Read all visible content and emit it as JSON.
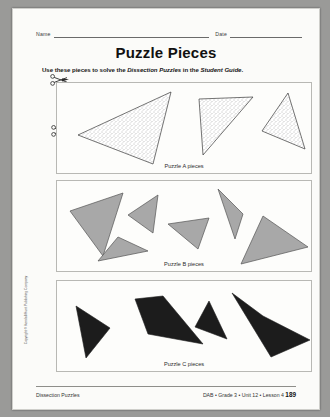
{
  "page": {
    "title": "Puzzle Pieces",
    "name_label": "Name",
    "date_label": "Date",
    "instruction_prefix": "Use these pieces to solve the ",
    "instruction_italic_1": "Dissection Puzzles",
    "instruction_middle": " in the ",
    "instruction_italic_2": "Student Guide",
    "instruction_suffix": ".",
    "copyright": "Copyright © Kendall/Hunt Publishing Company"
  },
  "footer": {
    "left": "Dissection Puzzles",
    "right": "DAB  •  Grade 3  •  Unit 12  •  Lesson 4",
    "page_number": "189"
  },
  "colors": {
    "paper": "#fbfbf9",
    "stipple_fill": "#ffffff",
    "stipple_dot": "#6b6b6b",
    "gray_fill": "#a8a8a8",
    "black_fill": "#1c1c1c",
    "outline": "#3a3a3a",
    "box_border": "#b8b8b4"
  },
  "puzzles": [
    {
      "id": "a",
      "label": "Puzzle A pieces",
      "fill_style": "stippled",
      "piece_count": 3,
      "pieces": [
        {
          "name": "piece-a-1",
          "shape": "triangle",
          "points": "21,52 114,9 96,81"
        },
        {
          "name": "piece-a-2",
          "shape": "triangle",
          "points": "142,16 196,14 146,72"
        },
        {
          "name": "piece-a-3",
          "shape": "triangle",
          "points": "231,10 248,66 205,48"
        }
      ]
    },
    {
      "id": "b",
      "label": "Puzzle B pieces",
      "fill_style": "gray",
      "piece_count": 6,
      "pieces": [
        {
          "name": "piece-b-1",
          "shape": "triangle",
          "points": "13,30 66,12 46,75"
        },
        {
          "name": "piece-b-2",
          "shape": "triangle",
          "points": "71,34 101,14 96,52"
        },
        {
          "name": "piece-b-3",
          "shape": "triangle",
          "points": "41,80 61,56 91,70"
        },
        {
          "name": "piece-b-4",
          "shape": "triangle",
          "points": "111,43 152,37 141,68"
        },
        {
          "name": "piece-b-5",
          "shape": "triangle",
          "points": "161,8 186,33 178,58"
        },
        {
          "name": "piece-b-6",
          "shape": "triangle",
          "points": "206,35 251,66 184,83"
        }
      ]
    },
    {
      "id": "c",
      "label": "Puzzle C pieces",
      "fill_style": "black",
      "piece_count": 4,
      "pieces": [
        {
          "name": "piece-c-1",
          "shape": "triangle",
          "points": "19,25 53,47 29,77"
        },
        {
          "name": "piece-c-2",
          "shape": "quadrilateral",
          "points": "78,18 106,15 146,63 91,53"
        },
        {
          "name": "piece-c-3",
          "shape": "triangle",
          "points": "152,20 170,58 138,46"
        },
        {
          "name": "piece-c-4",
          "shape": "quadrilateral",
          "points": "175,12 206,35 253,59 214,76"
        }
      ]
    }
  ]
}
